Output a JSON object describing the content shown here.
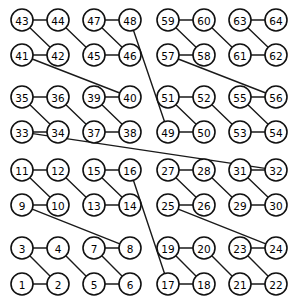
{
  "figure": {
    "type": "graph-diagram",
    "title": "",
    "background": "#ffffff",
    "width": 296,
    "height": 305,
    "node_fill": "#ffffff",
    "node_stroke": "#111111",
    "node_stroke_width": 1.6,
    "node_radius": 11,
    "edge_color": "#1a1a1a",
    "edge_width": 1.4,
    "label_font_size": 10.5,
    "label_color": "#000000"
  },
  "grid": {
    "columns_x": [
      22,
      58,
      94,
      130,
      168,
      204,
      240,
      276
    ],
    "rows_y": [
      20,
      55,
      97,
      132,
      170,
      205,
      248,
      284
    ]
  },
  "nodes": [
    {
      "id": 43,
      "label": "43",
      "x": 22,
      "y": 20
    },
    {
      "id": 44,
      "label": "44",
      "x": 58,
      "y": 20
    },
    {
      "id": 47,
      "label": "47",
      "x": 94,
      "y": 20
    },
    {
      "id": 48,
      "label": "48",
      "x": 130,
      "y": 20
    },
    {
      "id": 59,
      "label": "59",
      "x": 168,
      "y": 20
    },
    {
      "id": 60,
      "label": "60",
      "x": 204,
      "y": 20
    },
    {
      "id": 63,
      "label": "63",
      "x": 240,
      "y": 20
    },
    {
      "id": 64,
      "label": "64",
      "x": 276,
      "y": 20
    },
    {
      "id": 41,
      "label": "41",
      "x": 22,
      "y": 55
    },
    {
      "id": 42,
      "label": "42",
      "x": 58,
      "y": 55
    },
    {
      "id": 45,
      "label": "45",
      "x": 94,
      "y": 55
    },
    {
      "id": 46,
      "label": "46",
      "x": 130,
      "y": 55
    },
    {
      "id": 57,
      "label": "57",
      "x": 168,
      "y": 55
    },
    {
      "id": 58,
      "label": "58",
      "x": 204,
      "y": 55
    },
    {
      "id": 61,
      "label": "61",
      "x": 240,
      "y": 55
    },
    {
      "id": 62,
      "label": "62",
      "x": 276,
      "y": 55
    },
    {
      "id": 35,
      "label": "35",
      "x": 22,
      "y": 97
    },
    {
      "id": 36,
      "label": "36",
      "x": 58,
      "y": 97
    },
    {
      "id": 39,
      "label": "39",
      "x": 94,
      "y": 97
    },
    {
      "id": 40,
      "label": "40",
      "x": 130,
      "y": 97
    },
    {
      "id": 51,
      "label": "51",
      "x": 168,
      "y": 97
    },
    {
      "id": 52,
      "label": "52",
      "x": 204,
      "y": 97
    },
    {
      "id": 55,
      "label": "55",
      "x": 240,
      "y": 97
    },
    {
      "id": 56,
      "label": "56",
      "x": 276,
      "y": 97
    },
    {
      "id": 33,
      "label": "33",
      "x": 22,
      "y": 132
    },
    {
      "id": 34,
      "label": "34",
      "x": 58,
      "y": 132
    },
    {
      "id": 37,
      "label": "37",
      "x": 94,
      "y": 132
    },
    {
      "id": 38,
      "label": "38",
      "x": 130,
      "y": 132
    },
    {
      "id": 49,
      "label": "49",
      "x": 168,
      "y": 132
    },
    {
      "id": 50,
      "label": "50",
      "x": 204,
      "y": 132
    },
    {
      "id": 53,
      "label": "53",
      "x": 240,
      "y": 132
    },
    {
      "id": 54,
      "label": "54",
      "x": 276,
      "y": 132
    },
    {
      "id": 11,
      "label": "11",
      "x": 22,
      "y": 170
    },
    {
      "id": 12,
      "label": "12",
      "x": 58,
      "y": 170
    },
    {
      "id": 15,
      "label": "15",
      "x": 94,
      "y": 170
    },
    {
      "id": 16,
      "label": "16",
      "x": 130,
      "y": 170
    },
    {
      "id": 27,
      "label": "27",
      "x": 168,
      "y": 170
    },
    {
      "id": 28,
      "label": "28",
      "x": 204,
      "y": 170
    },
    {
      "id": 31,
      "label": "31",
      "x": 240,
      "y": 170
    },
    {
      "id": 32,
      "label": "32",
      "x": 276,
      "y": 170
    },
    {
      "id": 9,
      "label": "9",
      "x": 22,
      "y": 205
    },
    {
      "id": 10,
      "label": "10",
      "x": 58,
      "y": 205
    },
    {
      "id": 13,
      "label": "13",
      "x": 94,
      "y": 205
    },
    {
      "id": 14,
      "label": "14",
      "x": 130,
      "y": 205
    },
    {
      "id": 25,
      "label": "25",
      "x": 168,
      "y": 205
    },
    {
      "id": 26,
      "label": "26",
      "x": 204,
      "y": 205
    },
    {
      "id": 29,
      "label": "29",
      "x": 240,
      "y": 205
    },
    {
      "id": 30,
      "label": "30",
      "x": 276,
      "y": 205
    },
    {
      "id": 3,
      "label": "3",
      "x": 22,
      "y": 248
    },
    {
      "id": 4,
      "label": "4",
      "x": 58,
      "y": 248
    },
    {
      "id": 7,
      "label": "7",
      "x": 94,
      "y": 248
    },
    {
      "id": 8,
      "label": "8",
      "x": 130,
      "y": 248
    },
    {
      "id": 19,
      "label": "19",
      "x": 168,
      "y": 248
    },
    {
      "id": 20,
      "label": "20",
      "x": 204,
      "y": 248
    },
    {
      "id": 23,
      "label": "23",
      "x": 240,
      "y": 248
    },
    {
      "id": 24,
      "label": "24",
      "x": 276,
      "y": 248
    },
    {
      "id": 1,
      "label": "1",
      "x": 22,
      "y": 284
    },
    {
      "id": 2,
      "label": "2",
      "x": 58,
      "y": 284
    },
    {
      "id": 5,
      "label": "5",
      "x": 94,
      "y": 284
    },
    {
      "id": 6,
      "label": "6",
      "x": 130,
      "y": 284
    },
    {
      "id": 17,
      "label": "17",
      "x": 168,
      "y": 284
    },
    {
      "id": 18,
      "label": "18",
      "x": 204,
      "y": 284
    },
    {
      "id": 21,
      "label": "21",
      "x": 240,
      "y": 284
    },
    {
      "id": 22,
      "label": "22",
      "x": 276,
      "y": 284
    }
  ],
  "edges": [
    [
      43,
      44
    ],
    [
      43,
      42
    ],
    [
      44,
      45
    ],
    [
      41,
      42
    ],
    [
      45,
      46
    ],
    [
      47,
      48
    ],
    [
      47,
      46
    ],
    [
      41,
      40
    ],
    [
      35,
      36
    ],
    [
      35,
      34
    ],
    [
      36,
      37
    ],
    [
      33,
      34
    ],
    [
      37,
      38
    ],
    [
      39,
      40
    ],
    [
      39,
      38
    ],
    [
      33,
      32
    ],
    [
      59,
      60
    ],
    [
      59,
      58
    ],
    [
      60,
      61
    ],
    [
      57,
      58
    ],
    [
      61,
      62
    ],
    [
      63,
      64
    ],
    [
      63,
      62
    ],
    [
      57,
      56
    ],
    [
      51,
      52
    ],
    [
      51,
      50
    ],
    [
      52,
      53
    ],
    [
      49,
      50
    ],
    [
      53,
      54
    ],
    [
      55,
      56
    ],
    [
      55,
      54
    ],
    [
      48,
      49
    ],
    [
      11,
      12
    ],
    [
      11,
      10
    ],
    [
      12,
      13
    ],
    [
      9,
      10
    ],
    [
      13,
      14
    ],
    [
      15,
      16
    ],
    [
      15,
      14
    ],
    [
      9,
      8
    ],
    [
      3,
      4
    ],
    [
      3,
      2
    ],
    [
      4,
      5
    ],
    [
      1,
      2
    ],
    [
      5,
      6
    ],
    [
      7,
      8
    ],
    [
      7,
      6
    ],
    [
      27,
      28
    ],
    [
      27,
      26
    ],
    [
      28,
      29
    ],
    [
      25,
      26
    ],
    [
      29,
      30
    ],
    [
      31,
      32
    ],
    [
      31,
      30
    ],
    [
      25,
      24
    ],
    [
      19,
      20
    ],
    [
      19,
      18
    ],
    [
      20,
      21
    ],
    [
      17,
      18
    ],
    [
      21,
      22
    ],
    [
      23,
      24
    ],
    [
      23,
      22
    ],
    [
      17,
      16
    ]
  ]
}
